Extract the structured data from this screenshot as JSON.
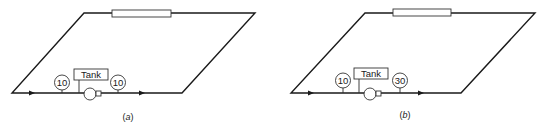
{
  "figure": {
    "panels": [
      {
        "id": "a",
        "caption_open": "(",
        "caption_letter": "a",
        "caption_close": ")",
        "tank_label": "Tank",
        "gauge_left_value": "10",
        "gauge_right_value": "10"
      },
      {
        "id": "b",
        "caption_open": "(",
        "caption_letter": "b",
        "caption_close": ")",
        "tank_label": "Tank",
        "gauge_left_value": "10",
        "gauge_right_value": "30"
      }
    ]
  },
  "colors": {
    "line": "#1a1a1a",
    "background": "#ffffff"
  }
}
